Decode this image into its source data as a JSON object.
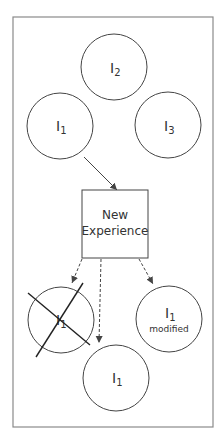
{
  "diagram": {
    "top_nodes": [
      {
        "id": "I2",
        "base": "I",
        "sub": "2"
      },
      {
        "id": "I1",
        "base": "I",
        "sub": "1"
      },
      {
        "id": "I3",
        "base": "I",
        "sub": "3"
      }
    ],
    "center_box": {
      "line1": "New",
      "line2": "Experience"
    },
    "outcomes": [
      {
        "id": "rejected",
        "base": "I",
        "sub": "1",
        "note": ""
      },
      {
        "id": "unchanged",
        "base": "I",
        "sub": "1",
        "note": ""
      },
      {
        "id": "modified",
        "base": "I",
        "sub": "1",
        "note": "modified"
      }
    ],
    "colors": {
      "stroke": "#444444",
      "frame": "#8a8a8a"
    }
  }
}
